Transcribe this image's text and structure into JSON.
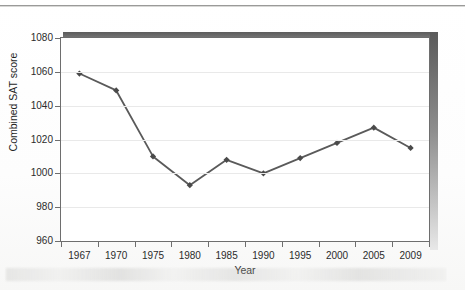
{
  "figure": {
    "yaxis_title": "Combined SAT score",
    "xaxis_title": "Year"
  },
  "chart_data": {
    "type": "line",
    "title": "",
    "subtitle": "",
    "xlabel": "Year",
    "ylabel": "Combined SAT score",
    "categories": [
      "1967",
      "1970",
      "1975",
      "1980",
      "1985",
      "1990",
      "1995",
      "2000",
      "2005",
      "2009"
    ],
    "values": [
      1059,
      1049,
      1010,
      993,
      1008,
      1000,
      1009,
      1018,
      1027,
      1015
    ],
    "series": [
      {
        "name": "Combined SAT score",
        "values": [
          1059,
          1049,
          1010,
          993,
          1008,
          1000,
          1009,
          1018,
          1027,
          1015
        ]
      }
    ],
    "ylim": [
      960,
      1080
    ],
    "ytick_labels": [
      "960",
      "980",
      "1000",
      "1020",
      "1040",
      "1060",
      "1080"
    ],
    "ytick_values": [
      960,
      980,
      1000,
      1020,
      1040,
      1060,
      1080
    ],
    "xtick_labels": [
      "1967",
      "1970",
      "1975",
      "1980",
      "1985",
      "1990",
      "1995",
      "2000",
      "2005",
      "2009"
    ],
    "grid": "horizontal",
    "legend": "none",
    "marker": "diamond",
    "line_color": "#5a5a5a",
    "marker_color": "#4a4a4a",
    "grid_color": "#e9e9e9",
    "frame_color": "#6e6e6e",
    "annotations": []
  }
}
